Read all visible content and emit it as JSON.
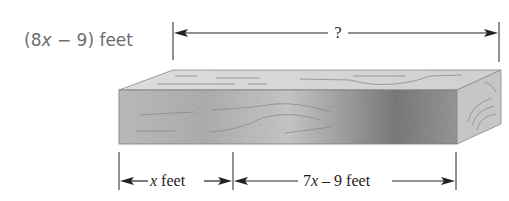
{
  "diagram": {
    "title_label": {
      "prefix": "(8",
      "var": "x",
      "suffix": " − 9) feet"
    },
    "top_dimension": {
      "label": "?"
    },
    "bottom_dimensions": [
      {
        "label": "x feet",
        "var": "x",
        "text": " feet"
      },
      {
        "label": "7x – 9 feet",
        "prefix": "7",
        "var": "x",
        "text": " – 9 feet"
      }
    ],
    "object": "wooden board (rectangular prism)",
    "colors": {
      "label_gray": "#6d6d6d",
      "line": "#222222",
      "wood_light": "#d8d8d8",
      "wood_dark": "#6a6a6a"
    }
  }
}
